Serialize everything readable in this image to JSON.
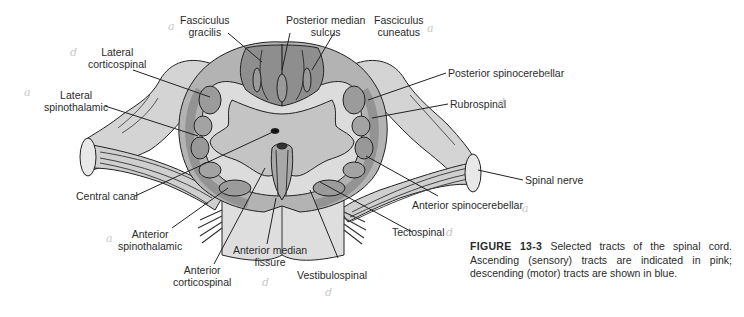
{
  "figure": {
    "number": "FIGURE 13-3",
    "caption": "Selected tracts of the spinal cord. Ascending (sensory) tracts are indicated in pink; descending (motor) tracts are shown in blue."
  },
  "colors": {
    "gray_matter": "#c8c8c8",
    "dark_tract": "#8e8e8e",
    "mid_tract": "#a9a9a9",
    "light_region": "#dcdcdc",
    "outline": "#222222"
  },
  "labels": {
    "fasciculus_gracilis": [
      "Fasciculus",
      "gracilis"
    ],
    "posterior_median_sulcus": [
      "Posterior median",
      "sulcus"
    ],
    "fasciculus_cuneatus": [
      "Fasciculus",
      "cuneatus"
    ],
    "lateral_corticospinal": [
      "Lateral",
      "corticospinal"
    ],
    "lateral_spinothalamic": [
      "Lateral",
      "spinothalamic"
    ],
    "posterior_spinocerebellar": "Posterior spinocerebellar",
    "rubrospinal": "Rubrospinal",
    "central_canal": "Central canal",
    "spinal_nerve": "Spinal nerve",
    "anterior_spinocerebellar": "Anterior spinocerebellar",
    "tectospinal": "Tectospinal",
    "anterior_spinothalamic": [
      "Anterior",
      "spinothalamic"
    ],
    "anterior_median_fissure": [
      "Anterior median",
      "fissure"
    ],
    "anterior_corticospinal": [
      "Anterior",
      "corticospinal"
    ],
    "vestibulospinal": "Vestibulospinal"
  },
  "pencil_marks": {
    "a": "a",
    "d": "d"
  }
}
